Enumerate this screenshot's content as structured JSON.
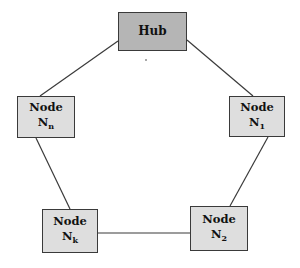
{
  "diagram": {
    "type": "ring topology with hub",
    "hub": {
      "label": "Hub",
      "color": "#b5b5b5"
    },
    "nodes": [
      {
        "id": "n1",
        "label": "Node",
        "name": "N",
        "subscript": "1",
        "color": "#dedede"
      },
      {
        "id": "n2",
        "label": "Node",
        "name": "N",
        "subscript": "2",
        "color": "#dedede"
      },
      {
        "id": "nk",
        "label": "Node",
        "name": "N",
        "subscript": "k",
        "color": "#dedede"
      },
      {
        "id": "nn",
        "label": "Node",
        "name": "N",
        "subscript": "n",
        "color": "#dedede"
      }
    ],
    "edges": [
      {
        "from": "hub",
        "to": "n1"
      },
      {
        "from": "n1",
        "to": "n2"
      },
      {
        "from": "n2",
        "to": "nk"
      },
      {
        "from": "nk",
        "to": "nn"
      },
      {
        "from": "nn",
        "to": "hub"
      }
    ],
    "line_color": "#3a3a3a"
  }
}
